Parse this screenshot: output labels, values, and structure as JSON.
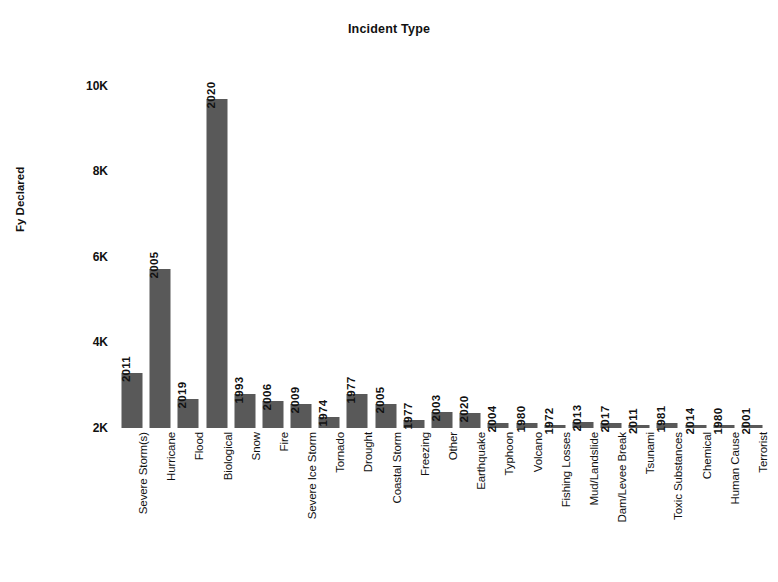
{
  "chart_data": {
    "type": "bar",
    "title": "Incident Type",
    "xlabel": "",
    "ylabel": "Fy Declared",
    "ylim": [
      2000,
      10600
    ],
    "ytick_labels": [
      "10K",
      "8K",
      "6K",
      "4K",
      "2K"
    ],
    "ytick_values": [
      10000,
      8000,
      6000,
      4000,
      2000
    ],
    "grid": false,
    "legend": null,
    "bar_color": "#595959",
    "categories": [
      "Severe Storm(s)",
      "Hurricane",
      "Flood",
      "Biological",
      "Snow",
      "Fire",
      "Severe Ice Storm",
      "Tornado",
      "Drought",
      "Coastal Storm",
      "Freezing",
      "Other",
      "Earthquake",
      "Typhoon",
      "Volcano",
      "Fishing Losses",
      "Mud/Landslide",
      "Dam/Levee Break",
      "Tsunami",
      "Toxic Substances",
      "Chemical",
      "Human Cause",
      "Terrorist"
    ],
    "values": [
      3280,
      5720,
      2680,
      9700,
      2800,
      2620,
      2560,
      2260,
      2790,
      2550,
      2180,
      2380,
      2360,
      2120,
      2110,
      2060,
      2130,
      2120,
      2050,
      2110,
      2050,
      2050,
      2070
    ],
    "point_labels": [
      "2011",
      "2005",
      "2019",
      "2020",
      "1993",
      "2006",
      "2009",
      "1974",
      "1977",
      "2005",
      "1977",
      "2003",
      "2020",
      "2004",
      "1980",
      "1972",
      "2013",
      "2017",
      "2011",
      "1981",
      "2014",
      "1980",
      "2001"
    ]
  }
}
